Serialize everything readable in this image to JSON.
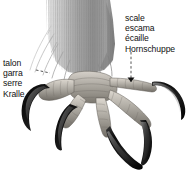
{
  "figure": {
    "background_color": "#ffffff",
    "width": 190,
    "height": 183
  },
  "labels": {
    "claw": {
      "name": "claw-label",
      "lines": [
        "talon",
        "garra",
        "serre",
        "Kralle"
      ],
      "languages": [
        "fr",
        "es",
        "fr",
        "de"
      ]
    },
    "scale": {
      "name": "scale-label",
      "lines": [
        "scale",
        "escama",
        "écaille",
        "Hornschuppe"
      ],
      "languages": [
        "en",
        "es",
        "fr",
        "de"
      ]
    }
  },
  "illustration": {
    "subject": "bird-foot",
    "parts": [
      {
        "name": "feathered-leg",
        "color": "#9a9a9a"
      },
      {
        "name": "tarsus-scales",
        "color": "#a8a49e"
      },
      {
        "name": "toe-front-left",
        "color": "#a8a49e"
      },
      {
        "name": "toe-front-center",
        "color": "#a8a49e"
      },
      {
        "name": "toe-front-right",
        "color": "#a8a49e"
      },
      {
        "name": "toe-hallux",
        "color": "#a8a49e"
      },
      {
        "name": "claw-left",
        "color": "#141414"
      },
      {
        "name": "claw-center-left",
        "color": "#141414"
      },
      {
        "name": "claw-center-right",
        "color": "#141414"
      },
      {
        "name": "claw-right",
        "color": "#141414"
      }
    ],
    "colors": {
      "claw_dark": "#141414",
      "claw_highlight": "#6e6e6e",
      "scale_light": "#cfcac3",
      "scale_mid": "#a8a49e",
      "scale_dark": "#6c6862",
      "feather_light": "#d2d2d2",
      "feather_mid": "#9a9a9a",
      "feather_dark": "#6a6a6a",
      "leader_line": "#2a2a2a"
    }
  }
}
